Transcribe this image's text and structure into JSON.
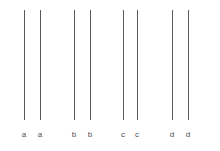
{
  "chart_data": {
    "type": "line",
    "title": "",
    "subtitle": "",
    "xlabel": "",
    "ylabel": "",
    "grid": false,
    "legend": null,
    "axis_visible": false,
    "background_color": "#ffffff",
    "line_color": "#5a5a5a",
    "label_color": "#4d4d4d",
    "categories": [
      "a",
      "a",
      "b",
      "b",
      "c",
      "c",
      "d",
      "d"
    ],
    "group_labels": [
      "a",
      "b",
      "c",
      "d"
    ],
    "series": [
      {
        "name": "vertical-range-bars",
        "values": [
          {
            "label": "a",
            "x": 24,
            "y_top": 10,
            "y_bottom": 120
          },
          {
            "label": "a",
            "x": 40,
            "y_top": 10,
            "y_bottom": 120
          },
          {
            "label": "b",
            "x": 74,
            "y_top": 10,
            "y_bottom": 120
          },
          {
            "label": "b",
            "x": 90,
            "y_top": 10,
            "y_bottom": 120
          },
          {
            "label": "c",
            "x": 123,
            "y_top": 10,
            "y_bottom": 120
          },
          {
            "label": "c",
            "x": 137,
            "y_top": 10,
            "y_bottom": 120
          },
          {
            "label": "d",
            "x": 172,
            "y_top": 10,
            "y_bottom": 120
          },
          {
            "label": "d",
            "x": 188,
            "y_top": 10,
            "y_bottom": 120
          }
        ]
      }
    ],
    "tick_labels": [
      {
        "text": "a",
        "x": 24,
        "y": 130
      },
      {
        "text": "a",
        "x": 40,
        "y": 130
      },
      {
        "text": "b",
        "x": 74,
        "y": 130
      },
      {
        "text": "b",
        "x": 90,
        "y": 130
      },
      {
        "text": "c",
        "x": 123,
        "y": 130
      },
      {
        "text": "c",
        "x": 137,
        "y": 130
      },
      {
        "text": "d",
        "x": 172,
        "y": 130
      },
      {
        "text": "d",
        "x": 188,
        "y": 130
      }
    ],
    "ylim": [
      10,
      120
    ],
    "xlim": [
      0,
      220
    ]
  }
}
